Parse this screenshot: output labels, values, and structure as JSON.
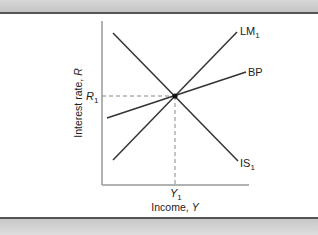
{
  "diagram": {
    "type": "IS-LM-BP",
    "axes": {
      "x_label_text": "Income, ",
      "x_label_var": "Y",
      "y_label_text": "Interest rate, ",
      "y_label_var": "R"
    },
    "curves": [
      {
        "id": "LM",
        "label_main": "LM",
        "label_sub": "1",
        "slope": "upward"
      },
      {
        "id": "BP",
        "label_main": "BP",
        "label_sub": "",
        "slope": "upward-flat"
      },
      {
        "id": "IS",
        "label_main": "IS",
        "label_sub": "1",
        "slope": "downward"
      }
    ],
    "equilibrium": {
      "r_main": "R",
      "r_sub": "1",
      "y_main": "Y",
      "y_sub": "1"
    },
    "colors": {
      "line": "#333333",
      "axis": "#999999",
      "dash": "#888888",
      "band": "#cfcfcf",
      "rule": "#555555"
    }
  }
}
